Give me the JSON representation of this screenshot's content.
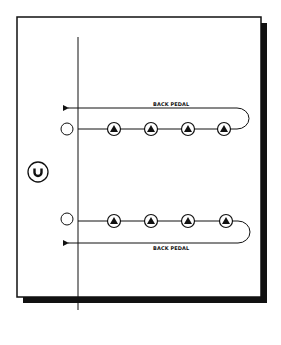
{
  "diagram": {
    "type": "football-drill",
    "colors": {
      "line": "#111111",
      "background": "#ffffff",
      "shadow": "#111111"
    },
    "coach": {
      "label": "C",
      "icon": "coach-circle"
    },
    "rows": [
      {
        "name": "top",
        "cone": "empty-circle",
        "players": 4,
        "player_icon": "triangle-in-circle",
        "movement": {
          "label": "BACK PEDAL",
          "direction": "right-to-left"
        }
      },
      {
        "name": "bottom",
        "cone": "empty-circle",
        "players": 4,
        "player_icon": "triangle-in-circle",
        "movement": {
          "label": "BACK PEDAL",
          "direction": "right-to-left"
        }
      }
    ]
  }
}
